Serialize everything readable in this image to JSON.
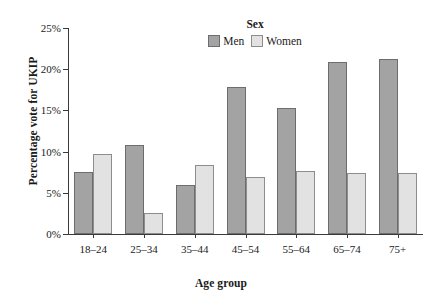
{
  "chart_data": {
    "type": "bar",
    "title": "",
    "xlabel": "Age group",
    "ylabel": "Percentage vote for UKIP",
    "categories": [
      "18–24",
      "25–34",
      "35–44",
      "45–54",
      "55–64",
      "65–74",
      "75+"
    ],
    "series": [
      {
        "name": "Men",
        "color": "#a3a3a3",
        "values": [
          7.5,
          10.8,
          6.0,
          17.8,
          15.3,
          20.9,
          21.3
        ]
      },
      {
        "name": "Women",
        "color": "#e2e2e2",
        "values": [
          9.7,
          2.5,
          8.4,
          6.9,
          7.7,
          7.4,
          7.4
        ]
      }
    ],
    "ylim": [
      0,
      25
    ],
    "yticks": [
      0,
      5,
      10,
      15,
      20,
      25
    ],
    "ytick_labels": [
      "0%",
      "5%",
      "10%",
      "15%",
      "20%",
      "25%"
    ],
    "grid": false,
    "legend": {
      "title": "Sex",
      "position": "top-center",
      "entries": [
        "Men",
        "Women"
      ]
    }
  }
}
